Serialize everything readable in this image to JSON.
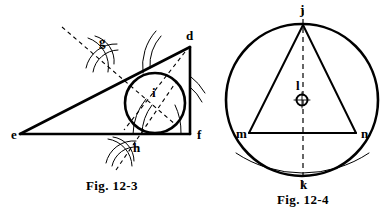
{
  "page": {
    "background_color": "#ffffff",
    "ink_color": "#000000",
    "width": 386,
    "height": 211
  },
  "figures": [
    {
      "id": "fig-12-3",
      "caption": "Fig. 12-3",
      "caption_pos": {
        "x": 112,
        "y": 190
      },
      "description": "Right triangle e-d-f with inscribed circle constructed by angle bisectors; construction arcs at g and h.",
      "points": [
        {
          "name": "e",
          "label": "e",
          "x": 20,
          "y": 134,
          "label_x": 11,
          "label_y": 139
        },
        {
          "name": "d",
          "label": "d",
          "x": 190,
          "y": 47,
          "label_x": 186,
          "label_y": 40
        },
        {
          "name": "f",
          "label": "f",
          "x": 190,
          "y": 134,
          "label_x": 197,
          "label_y": 139
        },
        {
          "name": "g",
          "label": "g",
          "x": 102,
          "y": 55,
          "label_x": 99,
          "label_y": 46
        },
        {
          "name": "h",
          "label": "h",
          "x": 131,
          "y": 145,
          "label_x": 133,
          "label_y": 152
        },
        {
          "name": "i",
          "label": "i",
          "x": 155,
          "y": 103,
          "label_x": 152,
          "label_y": 97
        }
      ],
      "incircle": {
        "cx": 155,
        "cy": 103,
        "r": 30
      },
      "triangle_sides": [
        "e-d",
        "d-f",
        "f-e"
      ]
    },
    {
      "id": "fig-12-4",
      "caption": "Fig. 12-4",
      "caption_pos": {
        "x": 303,
        "y": 203
      },
      "description": "Circle with center l circumscribing isosceles triangle j-m-n; dashed vertical diameter j-k and a thin construction arc through m and n.",
      "points": [
        {
          "name": "j",
          "label": "j",
          "x": 303,
          "y": 25,
          "label_x": 300,
          "label_y": 14
        },
        {
          "name": "k",
          "label": "k",
          "x": 303,
          "y": 176,
          "label_x": 300,
          "label_y": 188
        },
        {
          "name": "l",
          "label": "l",
          "x": 302,
          "y": 100,
          "label_x": 296,
          "label_y": 89
        },
        {
          "name": "m",
          "label": "m",
          "x": 249,
          "y": 133,
          "label_x": 237,
          "label_y": 138
        },
        {
          "name": "n",
          "label": "n",
          "x": 356,
          "y": 133,
          "label_x": 361,
          "label_y": 138
        }
      ],
      "circumcircle": {
        "cx": 302,
        "cy": 100,
        "r": 76
      },
      "center_marker": {
        "cx": 302,
        "cy": 100,
        "r": 5.5,
        "style": "circled-cross"
      },
      "triangle_sides": [
        "j-m",
        "j-n",
        "m-n"
      ],
      "diameter": "j-k"
    }
  ]
}
